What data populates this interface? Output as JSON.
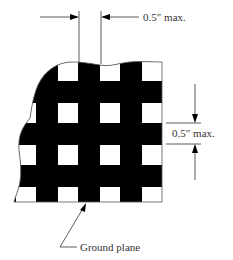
{
  "diagram": {
    "colors": {
      "ink": "#000000",
      "line": "#444444",
      "text": "#333333",
      "background": "#ffffff"
    },
    "dimensions": {
      "horizontal": {
        "label": "0.5″ max.",
        "meaning": "gap width between conductors"
      },
      "vertical": {
        "label": "0.5″ max.",
        "meaning": "gap height between conductors"
      }
    },
    "callout": {
      "label": "Ground plane"
    },
    "grid": {
      "rows": 4,
      "cols": 4,
      "description": "black conductor mesh with square white openings"
    }
  }
}
